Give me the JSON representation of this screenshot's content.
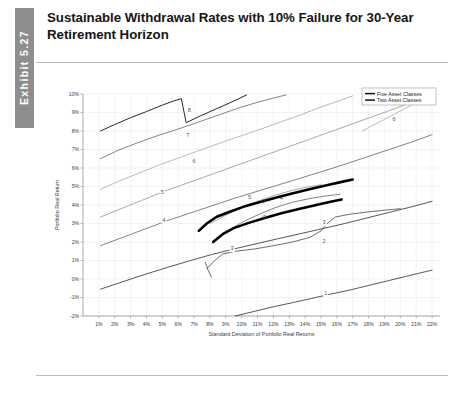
{
  "exhibit": {
    "tab_label": "Exhibit 5.27",
    "title": "Sustainable Withdrawal Rates with 10% Failure for 30-Year Retirement Horizon"
  },
  "chart_data": {
    "type": "line",
    "title": "Sustainable Withdrawal Rates with 10% Failure for 30-Year Retirement Horizon",
    "xlabel": "Standard Deviation of Portfolio Real Returns",
    "ylabel": "Portfolio Real Return",
    "xlim": [
      0,
      22.5
    ],
    "ylim": [
      -2,
      10
    ],
    "grid": true,
    "legend_position": "top-right",
    "x_tick_labels": [
      "1%",
      "2%",
      "3%",
      "4%",
      "5%",
      "6%",
      "7%",
      "8%",
      "9%",
      "10%",
      "11%",
      "12%",
      "13%",
      "14%",
      "15%",
      "16%",
      "17%",
      "18%",
      "19%",
      "20%",
      "21%",
      "22%"
    ],
    "x_tick_values": [
      1,
      2,
      3,
      4,
      5,
      6,
      7,
      8,
      9,
      10,
      11,
      12,
      13,
      14,
      15,
      16,
      17,
      18,
      19,
      20,
      21,
      22
    ],
    "y_tick_labels": [
      "10%",
      "9%",
      "8%",
      "7%",
      "6%",
      "5%",
      "4%",
      "3%",
      "2%",
      "1%",
      "0%",
      "-1%",
      "-2%"
    ],
    "y_tick_values": [
      10,
      9,
      8,
      7,
      6,
      5,
      4,
      3,
      2,
      1,
      0,
      -1,
      -2
    ],
    "legend": [
      {
        "name": "Five Asset Classes",
        "color": "#111111"
      },
      {
        "name": "Two Asset Classes",
        "color": "#111111"
      }
    ],
    "contours": [
      {
        "level": 8,
        "label": "8",
        "color": "#1d1d1d",
        "label_x": 6.7,
        "label_y": 9.05,
        "points": [
          [
            1.1,
            8.0
          ],
          [
            2.0,
            8.35
          ],
          [
            3.0,
            8.72
          ],
          [
            4.0,
            9.05
          ],
          [
            5.0,
            9.4
          ],
          [
            5.7,
            9.62
          ],
          [
            6.2,
            9.75
          ],
          [
            6.5,
            8.45
          ],
          [
            7.3,
            8.78
          ],
          [
            8.2,
            9.12
          ],
          [
            9.2,
            9.5
          ],
          [
            9.9,
            9.78
          ],
          [
            10.3,
            9.95
          ]
        ]
      },
      {
        "level": 7,
        "label": "7",
        "color": "#7d7d7d",
        "label_x": 6.6,
        "label_y": 7.7,
        "points": [
          [
            1.1,
            6.5
          ],
          [
            2.2,
            6.95
          ],
          [
            3.4,
            7.35
          ],
          [
            4.6,
            7.72
          ],
          [
            5.8,
            8.05
          ],
          [
            7.0,
            8.4
          ],
          [
            8.0,
            8.7
          ],
          [
            9.0,
            9.0
          ],
          [
            10.0,
            9.3
          ],
          [
            11.0,
            9.55
          ],
          [
            12.0,
            9.78
          ],
          [
            12.8,
            9.95
          ]
        ]
      },
      {
        "level": 6,
        "label": "6",
        "color": "#a3a3a3",
        "label_x": 7.0,
        "label_y": 6.25,
        "points": [
          [
            1.1,
            4.85
          ],
          [
            2.3,
            5.3
          ],
          [
            3.6,
            5.75
          ],
          [
            4.9,
            6.2
          ],
          [
            6.2,
            6.6
          ],
          [
            7.5,
            7.0
          ],
          [
            8.8,
            7.4
          ],
          [
            10.0,
            7.75
          ],
          [
            11.2,
            8.1
          ],
          [
            12.5,
            8.5
          ],
          [
            13.8,
            8.9
          ],
          [
            15.0,
            9.3
          ],
          [
            16.2,
            9.65
          ],
          [
            17.0,
            9.9
          ]
        ]
      },
      {
        "level": 6,
        "label": "6",
        "color": "#a3a3a3",
        "label_x": 19.6,
        "label_y": 8.55,
        "points": [
          [
            17.6,
            8.0
          ],
          [
            18.6,
            8.45
          ],
          [
            19.6,
            8.9
          ],
          [
            20.6,
            9.35
          ],
          [
            21.5,
            9.75
          ],
          [
            22.0,
            9.95
          ]
        ],
        "is_secondary": true
      },
      {
        "level": 5,
        "label": "5",
        "color": "#8c8c8c",
        "label_x": 5.0,
        "label_y": 4.6,
        "points": [
          [
            1.1,
            3.35
          ],
          [
            2.4,
            3.8
          ],
          [
            3.7,
            4.25
          ],
          [
            5.0,
            4.7
          ],
          [
            6.3,
            5.1
          ],
          [
            7.6,
            5.5
          ],
          [
            8.9,
            5.9
          ],
          [
            10.2,
            6.3
          ],
          [
            11.5,
            6.7
          ],
          [
            12.8,
            7.1
          ],
          [
            14.1,
            7.5
          ],
          [
            15.4,
            7.9
          ],
          [
            16.7,
            8.3
          ],
          [
            18.0,
            8.7
          ],
          [
            19.3,
            9.1
          ],
          [
            20.6,
            9.5
          ],
          [
            21.8,
            9.9
          ]
        ]
      },
      {
        "level": 5,
        "label": "5",
        "color": "#8c8c8c",
        "label_x": 10.5,
        "label_y": 4.3,
        "points": [
          [
            8.0,
            3.0
          ],
          [
            9.0,
            3.45
          ],
          [
            10.0,
            3.85
          ],
          [
            11.0,
            4.2
          ],
          [
            12.0,
            4.5
          ],
          [
            13.0,
            4.75
          ],
          [
            14.0,
            4.95
          ],
          [
            15.0,
            5.1
          ]
        ],
        "is_secondary": true
      },
      {
        "level": 4,
        "label": "4",
        "color": "#5a5a5a",
        "label_x": 5.1,
        "label_y": 3.1,
        "points": [
          [
            1.1,
            1.8
          ],
          [
            2.5,
            2.25
          ],
          [
            3.9,
            2.7
          ],
          [
            5.3,
            3.15
          ],
          [
            6.7,
            3.55
          ],
          [
            8.1,
            3.95
          ],
          [
            9.5,
            4.35
          ],
          [
            10.9,
            4.72
          ],
          [
            12.3,
            5.08
          ],
          [
            13.7,
            5.45
          ],
          [
            15.1,
            5.82
          ],
          [
            16.5,
            6.2
          ],
          [
            17.9,
            6.6
          ],
          [
            19.3,
            7.0
          ],
          [
            20.7,
            7.4
          ],
          [
            22.0,
            7.8
          ]
        ]
      },
      {
        "level": 4,
        "label": "4",
        "color": "#5a5a5a",
        "label_x": 12.5,
        "label_y": 4.25,
        "points": [
          [
            9.1,
            2.6
          ],
          [
            10.1,
            3.1
          ],
          [
            11.1,
            3.5
          ],
          [
            12.1,
            3.85
          ],
          [
            13.2,
            4.15
          ],
          [
            14.3,
            4.35
          ],
          [
            15.4,
            4.5
          ],
          [
            16.2,
            4.58
          ]
        ],
        "is_secondary": true
      },
      {
        "level": 3,
        "label": "3",
        "color": "#3c3c3c",
        "label_x": 9.4,
        "label_y": 1.55,
        "points": [
          [
            7.8,
            0.55
          ],
          [
            8.3,
            1.0
          ],
          [
            8.8,
            1.35
          ],
          [
            9.6,
            1.5
          ],
          [
            10.8,
            1.62
          ],
          [
            12.0,
            1.8
          ],
          [
            13.2,
            2.0
          ],
          [
            14.3,
            2.25
          ],
          [
            15.0,
            2.6
          ],
          [
            15.4,
            3.0
          ],
          [
            15.9,
            3.35
          ],
          [
            16.8,
            3.5
          ],
          [
            17.9,
            3.62
          ],
          [
            19.0,
            3.72
          ],
          [
            20.0,
            3.8
          ]
        ]
      },
      {
        "level": 3,
        "label": "3",
        "color": "#3c3c3c",
        "label_x": 15.2,
        "label_y": 2.95,
        "points": [
          [
            7.7,
            0.9
          ],
          [
            7.9,
            0.45
          ],
          [
            8.1,
            0.1
          ]
        ],
        "is_secondary": true
      },
      {
        "level": 2,
        "label": "2",
        "color": "#1f1f1f",
        "label_x": 15.2,
        "label_y": 1.95,
        "points": [
          [
            1.1,
            -0.55
          ],
          [
            2.5,
            -0.15
          ],
          [
            3.9,
            0.25
          ],
          [
            5.3,
            0.62
          ],
          [
            6.7,
            0.98
          ],
          [
            8.1,
            1.32
          ],
          [
            9.5,
            1.62
          ],
          [
            10.9,
            1.9
          ],
          [
            12.3,
            2.18
          ],
          [
            13.7,
            2.45
          ],
          [
            15.1,
            2.72
          ],
          [
            16.5,
            3.0
          ],
          [
            17.9,
            3.3
          ],
          [
            19.3,
            3.6
          ],
          [
            20.7,
            3.9
          ],
          [
            22.0,
            4.2
          ]
        ]
      },
      {
        "level": 1,
        "label": "1",
        "color": "#1f1f1f",
        "label_x": 15.3,
        "label_y": -0.85,
        "points": [
          [
            9.6,
            -2.0
          ],
          [
            10.8,
            -1.75
          ],
          [
            12.0,
            -1.5
          ],
          [
            13.2,
            -1.28
          ],
          [
            14.4,
            -1.05
          ],
          [
            15.6,
            -0.82
          ],
          [
            16.8,
            -0.6
          ],
          [
            18.0,
            -0.35
          ],
          [
            19.2,
            -0.1
          ],
          [
            20.4,
            0.15
          ],
          [
            21.6,
            0.4
          ],
          [
            22.0,
            0.48
          ]
        ]
      }
    ],
    "frontiers": [
      {
        "name": "Five Asset Classes",
        "color": "#000000",
        "width": 2.6,
        "points": [
          [
            7.3,
            2.6
          ],
          [
            7.8,
            3.0
          ],
          [
            8.4,
            3.35
          ],
          [
            9.2,
            3.62
          ],
          [
            10.1,
            3.9
          ],
          [
            11.1,
            4.15
          ],
          [
            12.2,
            4.4
          ],
          [
            13.3,
            4.65
          ],
          [
            14.4,
            4.88
          ],
          [
            15.5,
            5.1
          ],
          [
            16.3,
            5.25
          ],
          [
            17.0,
            5.38
          ]
        ]
      },
      {
        "name": "Two Asset Classes",
        "color": "#000000",
        "width": 2.6,
        "points": [
          [
            8.2,
            2.0
          ],
          [
            8.8,
            2.42
          ],
          [
            9.5,
            2.75
          ],
          [
            10.4,
            3.02
          ],
          [
            11.4,
            3.28
          ],
          [
            12.5,
            3.55
          ],
          [
            13.6,
            3.78
          ],
          [
            14.7,
            4.0
          ],
          [
            15.6,
            4.18
          ],
          [
            16.3,
            4.3
          ]
        ]
      }
    ],
    "marker_points": [
      {
        "x": 11.35,
        "y": 4.2
      },
      {
        "x": 11.45,
        "y": 3.35
      }
    ]
  }
}
